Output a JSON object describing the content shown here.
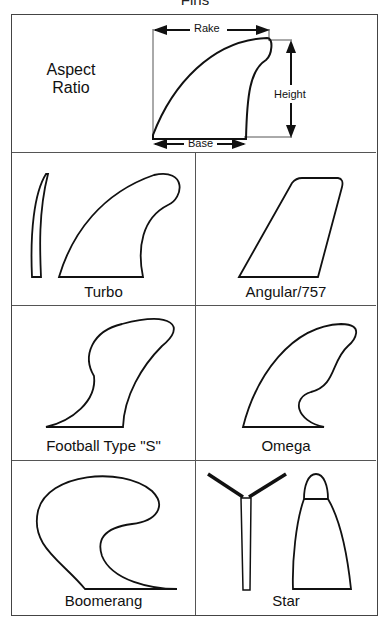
{
  "title": "Fins",
  "aspect": {
    "label_line1": "Aspect",
    "label_line2": "Ratio",
    "dims": {
      "rake": "Rake",
      "height": "Height",
      "base": "Base"
    }
  },
  "fins": [
    {
      "name": "Turbo"
    },
    {
      "name": "Angular/757"
    },
    {
      "name": "Football Type \"S\""
    },
    {
      "name": "Omega"
    },
    {
      "name": "Boomerang"
    },
    {
      "name": "Star"
    }
  ]
}
